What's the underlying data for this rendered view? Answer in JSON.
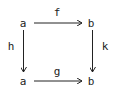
{
  "diagram": {
    "type": "commutative-square",
    "colors": {
      "ink": "#222222",
      "background": "#ffffff"
    },
    "nodes": {
      "top_left": "a",
      "top_right": "b",
      "bottom_left": "a",
      "bottom_right": "b"
    },
    "arrows": {
      "top": {
        "label": "f",
        "from": "top_left",
        "to": "top_right"
      },
      "left": {
        "label": "h",
        "from": "top_left",
        "to": "bottom_left"
      },
      "right": {
        "label": "k",
        "from": "top_right",
        "to": "bottom_right"
      },
      "bottom": {
        "label": "g",
        "from": "bottom_left",
        "to": "bottom_right"
      }
    }
  }
}
